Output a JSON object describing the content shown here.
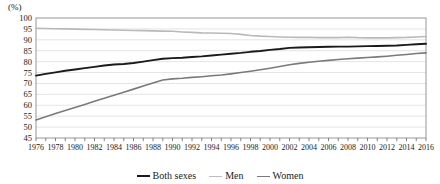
{
  "chart_data": {
    "type": "line",
    "title": "",
    "subtitle": "",
    "unit_label": "(%)",
    "xlabel": "",
    "ylabel": "",
    "ylim": [
      45,
      100
    ],
    "ytick_step": 5,
    "yticks": [
      100,
      95,
      90,
      85,
      80,
      75,
      70,
      65,
      60,
      55,
      50,
      45
    ],
    "grid": true,
    "grid_axis": "y",
    "legend_position": "bottom-center",
    "x_tick_every": 1,
    "x_label_every": 2,
    "xlim": [
      1976,
      2016
    ],
    "x": [
      1976,
      1977,
      1978,
      1979,
      1980,
      1981,
      1982,
      1983,
      1984,
      1985,
      1986,
      1987,
      1988,
      1989,
      1990,
      1991,
      1992,
      1993,
      1994,
      1995,
      1996,
      1997,
      1998,
      1999,
      2000,
      2001,
      2002,
      2003,
      2004,
      2005,
      2006,
      2007,
      2008,
      2009,
      2010,
      2011,
      2012,
      2013,
      2014,
      2015,
      2016
    ],
    "xtick_labels": [
      "1976",
      "1978",
      "1980",
      "1982",
      "1984",
      "1986",
      "1988",
      "1990",
      "1992",
      "1994",
      "1996",
      "1998",
      "2000",
      "2002",
      "2004",
      "2006",
      "2008",
      "2010",
      "2012",
      "2014",
      "2016"
    ],
    "series": [
      {
        "name": "Both sexes",
        "color": "#1a1a1a",
        "width": 1.9,
        "values": [
          73.6,
          74.4,
          75.1,
          75.8,
          76.4,
          77.0,
          77.6,
          78.2,
          78.7,
          78.9,
          79.4,
          80.0,
          80.7,
          81.3,
          81.6,
          81.8,
          82.1,
          82.4,
          82.8,
          83.2,
          83.6,
          84.0,
          84.5,
          84.9,
          85.4,
          85.8,
          86.3,
          86.5,
          86.6,
          86.7,
          86.8,
          86.9,
          86.9,
          87.0,
          87.1,
          87.2,
          87.3,
          87.4,
          87.7,
          88.0,
          88.2
        ]
      },
      {
        "name": "Men",
        "color": "#b9b9b9",
        "width": 1.6,
        "values": [
          95.3,
          95.2,
          95.1,
          95.0,
          94.9,
          94.8,
          94.7,
          94.6,
          94.5,
          94.4,
          94.3,
          94.2,
          94.1,
          94.0,
          93.9,
          93.6,
          93.4,
          93.2,
          93.1,
          93.0,
          92.9,
          92.5,
          92.0,
          91.7,
          91.5,
          91.3,
          91.2,
          91.1,
          91.1,
          91.0,
          91.0,
          91.0,
          91.2,
          91.0,
          90.9,
          90.9,
          90.9,
          91.0,
          91.1,
          91.3,
          91.5
        ]
      },
      {
        "name": "Women",
        "color": "#7a7a7a",
        "width": 1.6,
        "values": [
          53.3,
          54.7,
          56.2,
          57.6,
          59.0,
          60.4,
          61.8,
          63.2,
          64.6,
          66.0,
          67.4,
          68.8,
          70.2,
          71.6,
          72.1,
          72.4,
          72.8,
          73.1,
          73.5,
          73.9,
          74.4,
          75.0,
          75.6,
          76.3,
          77.0,
          77.8,
          78.6,
          79.2,
          79.7,
          80.2,
          80.6,
          81.0,
          81.3,
          81.6,
          81.9,
          82.2,
          82.5,
          82.9,
          83.3,
          83.7,
          84.0
        ]
      }
    ]
  },
  "legend": {
    "items": [
      {
        "label": "Both sexes",
        "color": "#1a1a1a",
        "thickness": 2.2
      },
      {
        "label": "Men",
        "color": "#bdbdbd",
        "thickness": 1.6
      },
      {
        "label": "Women",
        "color": "#7a7a7a",
        "thickness": 1.8
      }
    ]
  },
  "axes": {
    "frame_color": "#8c8c8c",
    "grid_color": "#d8d8d8",
    "tick_color": "#555555"
  }
}
